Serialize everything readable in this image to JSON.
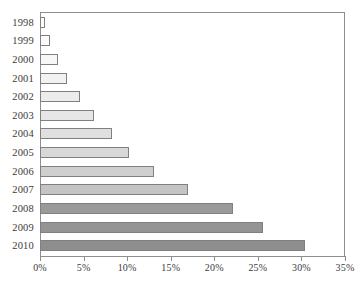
{
  "chart_data": {
    "type": "bar",
    "orientation": "horizontal",
    "title": "",
    "subtitle": "",
    "xlabel": "",
    "ylabel": "",
    "xlim": [
      0,
      35
    ],
    "grid": false,
    "legend": null,
    "xtick_labels": [
      "0%",
      "5%",
      "10%",
      "15%",
      "20%",
      "25%",
      "30%",
      "35%"
    ],
    "xtick_values": [
      0,
      5,
      10,
      15,
      20,
      25,
      30,
      35
    ],
    "categories": [
      "1998",
      "1999",
      "2000",
      "2001",
      "2002",
      "2003",
      "2004",
      "2005",
      "2006",
      "2007",
      "2008",
      "2009",
      "2010"
    ],
    "values": [
      0.6,
      1.2,
      2.1,
      3.1,
      4.6,
      6.2,
      8.3,
      10.2,
      13.1,
      17.0,
      22.2,
      25.6,
      30.4
    ],
    "value_labels": [
      "0.6%",
      "1.2%",
      "2.1%",
      "3.1%",
      "4.6%",
      "6.2%",
      "8.3%",
      "10.2%",
      "13.1%",
      "17.0%",
      "22.2%",
      "25.6%",
      "30.4%"
    ],
    "bar_colors": [
      "#fdfdfd",
      "#fbfbfb",
      "#f7f7f7",
      "#f2f2f2",
      "#ececec",
      "#e6e6e6",
      "#e0e0e0",
      "#d8d8d8",
      "#cfcfcf",
      "#c4c4c4",
      "#9a9a9a",
      "#949494",
      "#8e8e8e"
    ],
    "bar_border_color": "#808080",
    "axis_color": "#8e8e8e",
    "text_color": "#3b3b3b",
    "background_color": "#ffffff"
  }
}
